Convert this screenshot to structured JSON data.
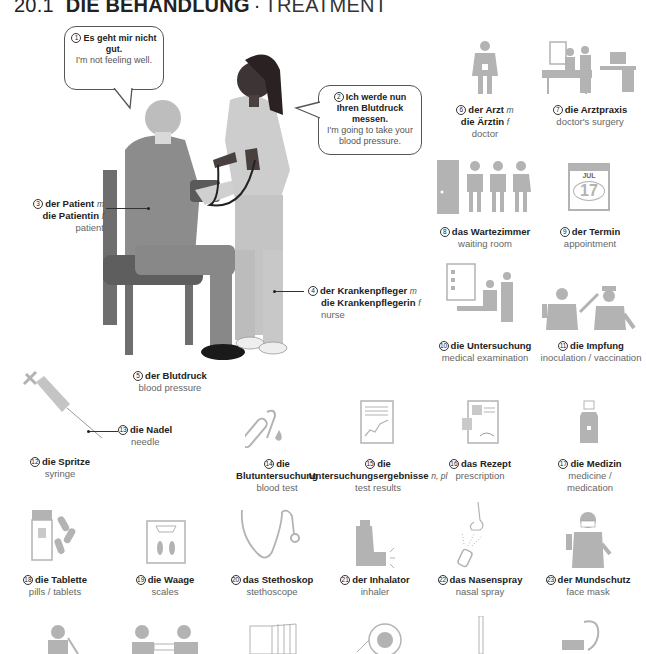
{
  "header": {
    "section_number": "20.1",
    "title_de": "DIE BEHANDLUNG",
    "separator": "·",
    "title_en": "TREATMENT"
  },
  "colors": {
    "icon_gray": "#b3b3b3",
    "patient_jacket": "#8a8a8a",
    "nurse_uniform": "#c9c9c9",
    "skin_dark": "#4a4040",
    "chair": "#6e6e6e",
    "text_dark": "#222222",
    "text_light": "#666666"
  },
  "speech_bubbles": [
    {
      "num": "1",
      "de": "Es geht mir nicht gut.",
      "en": "I'm not feeling well."
    },
    {
      "num": "2",
      "de": "Ich werde nun Ihren Blutdruck messen.",
      "en": "I'm going to take your blood pressure."
    }
  ],
  "items": [
    {
      "num": "3",
      "de": "der Patient",
      "g1": "m",
      "de2": "die Patientin",
      "g2": "f",
      "en": "patient"
    },
    {
      "num": "4",
      "de": "der Krankenpfleger",
      "g1": "m",
      "de2": "die Krankenpflegerin",
      "g2": "f",
      "en": "nurse"
    },
    {
      "num": "5",
      "de": "der Blutdruck",
      "en": "blood pressure"
    },
    {
      "num": "6",
      "de": "der Arzt",
      "g1": "m",
      "de2": "die Ärztin",
      "g2": "f",
      "en": "doctor"
    },
    {
      "num": "7",
      "de": "die Arztpraxis",
      "en": "doctor's surgery"
    },
    {
      "num": "8",
      "de": "das Wartezimmer",
      "en": "waiting room"
    },
    {
      "num": "9",
      "de": "der Termin",
      "en": "appointment",
      "calendar_month": "JUL",
      "calendar_day": "17"
    },
    {
      "num": "10",
      "de": "die Untersuchung",
      "en": "medical examination"
    },
    {
      "num": "11",
      "de": "die Impfung",
      "en": "inoculation / vaccination"
    },
    {
      "num": "12",
      "de": "die Spritze",
      "en": "syringe"
    },
    {
      "num": "13",
      "de": "die Nadel",
      "en": "needle"
    },
    {
      "num": "14",
      "de": "die Blutuntersuchung",
      "en": "blood test"
    },
    {
      "num": "15",
      "de": "die Untersuchungsergebnisse",
      "g1": "n, pl",
      "en": "test results"
    },
    {
      "num": "16",
      "de": "das Rezept",
      "en": "prescription"
    },
    {
      "num": "17",
      "de": "die Medizin",
      "en": "medicine / medication"
    },
    {
      "num": "18",
      "de": "die Tablette",
      "en": "pills / tablets"
    },
    {
      "num": "19",
      "de": "die Waage",
      "en": "scales"
    },
    {
      "num": "20",
      "de": "das Stethoskop",
      "en": "stethoscope"
    },
    {
      "num": "21",
      "de": "der Inhalator",
      "en": "inhaler"
    },
    {
      "num": "22",
      "de": "das Nasenspray",
      "en": "nasal spray"
    },
    {
      "num": "23",
      "de": "der Mundschutz",
      "en": "face mask"
    }
  ]
}
